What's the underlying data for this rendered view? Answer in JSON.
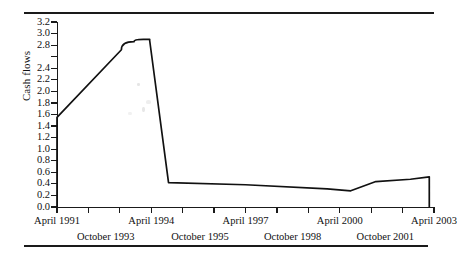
{
  "figure": {
    "ylabel": "Cash flows",
    "rules": {
      "top": true,
      "bottom": true
    }
  },
  "chart_data": {
    "type": "line",
    "title": "",
    "xlabel": "",
    "ylabel": "Cash flows",
    "ylim": [
      0.0,
      3.2
    ],
    "grid": false,
    "legend": null,
    "y_ticks": [
      0.0,
      0.2,
      0.4,
      0.6,
      0.8,
      1.0,
      1.2,
      1.4,
      1.6,
      1.8,
      2.0,
      2.2,
      2.4,
      2.6,
      2.8,
      3.0,
      3.2
    ],
    "y_tick_labels": [
      "0.0",
      "0.2",
      "0.4",
      "0.6",
      "0.8",
      "1.0",
      "1.2",
      "1.4",
      "1.6",
      "1.8",
      "2.0",
      "2.2",
      "2.4",
      "",
      "2.8",
      "3.0",
      "3.2"
    ],
    "x_tick_labels_upper": [
      "April 1991",
      "April 1994",
      "April 1997",
      "April 2000",
      "April 2003"
    ],
    "x_tick_labels_lower": [
      "October 1993",
      "October 1995",
      "October 1998",
      "October 2001"
    ],
    "x_axis_start": "April 1991",
    "x_axis_end": "April 2003",
    "x": [
      0.0,
      0.0,
      2.05,
      2.45,
      2.75,
      2.95,
      2.95,
      3.55,
      6.0,
      8.6,
      9.35,
      10.15,
      11.25,
      11.85,
      11.85
    ],
    "y": [
      0.0,
      1.55,
      2.72,
      2.86,
      2.9,
      2.9,
      2.88,
      0.42,
      0.385,
      0.315,
      0.28,
      0.44,
      0.48,
      0.52,
      0.0
    ],
    "series": [
      {
        "name": "Cash flows",
        "points": [
          {
            "x_label": "April 1991",
            "x": 0.0,
            "y": 0.0
          },
          {
            "x_label": "April 1991",
            "x": 0.0,
            "y": 1.55
          },
          {
            "x_label": "mid 1993",
            "x": 2.05,
            "y": 2.72
          },
          {
            "x_label": "late 1993",
            "x": 2.45,
            "y": 2.86
          },
          {
            "x_label": "peak",
            "x": 2.75,
            "y": 2.9
          },
          {
            "x_label": "peak end",
            "x": 2.95,
            "y": 2.9
          },
          {
            "x_label": "drop top",
            "x": 2.95,
            "y": 2.88
          },
          {
            "x_label": "drop bottom",
            "x": 3.55,
            "y": 0.42
          },
          {
            "x_label": "April 1997",
            "x": 6.0,
            "y": 0.385
          },
          {
            "x_label": "pre-2000",
            "x": 8.6,
            "y": 0.315
          },
          {
            "x_label": "April 2000 min",
            "x": 9.35,
            "y": 0.28
          },
          {
            "x_label": "late 2000",
            "x": 10.15,
            "y": 0.44
          },
          {
            "x_label": "October 2001",
            "x": 11.25,
            "y": 0.48
          },
          {
            "x_label": "April 2003",
            "x": 11.85,
            "y": 0.52
          },
          {
            "x_label": "April 2003 end",
            "x": 11.85,
            "y": 0.0
          }
        ]
      }
    ]
  }
}
